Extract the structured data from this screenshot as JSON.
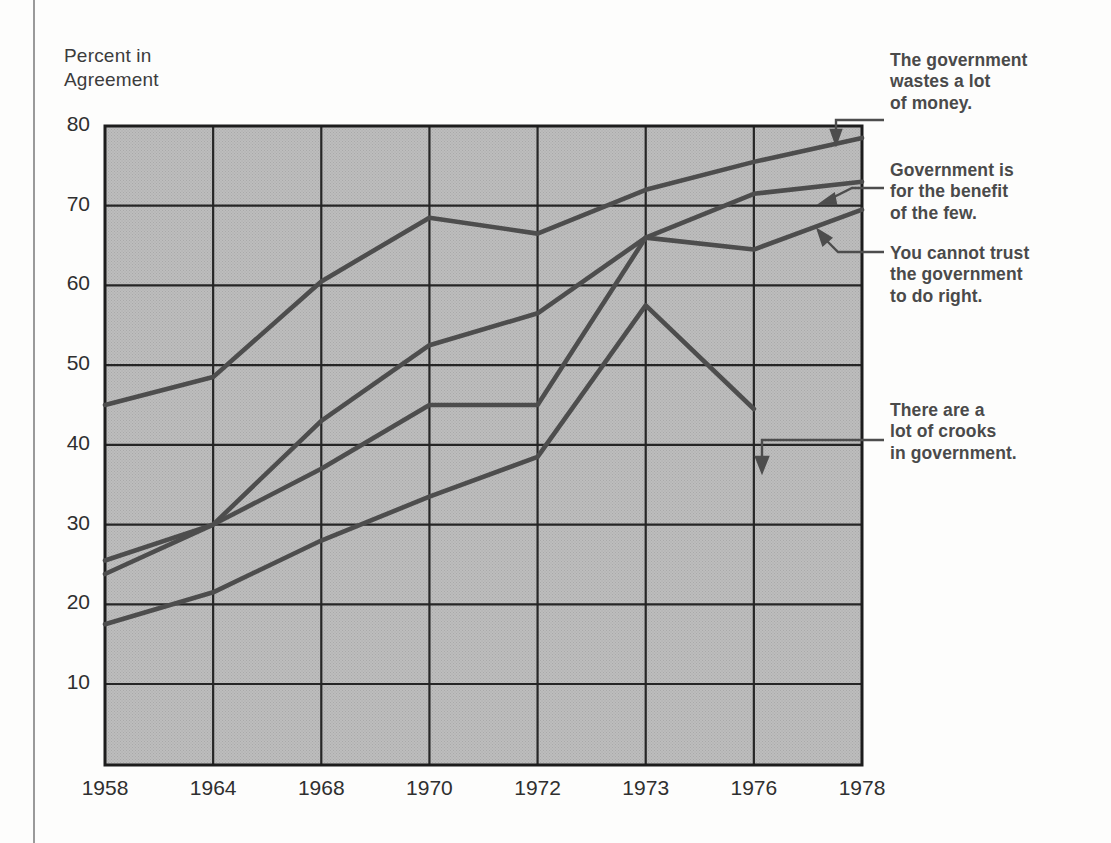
{
  "chart_data": {
    "type": "line",
    "title": "",
    "ylabel": "Percent in\nAgreement",
    "xlabel": "",
    "categories": [
      "1958",
      "1964",
      "1968",
      "1970",
      "1972",
      "1973",
      "1976",
      "1978"
    ],
    "yticks": [
      80,
      70,
      60,
      50,
      40,
      30,
      20,
      10
    ],
    "ylim": [
      0,
      80
    ],
    "grid": true,
    "legend_position": "right-annotations",
    "plot_background": "#b9b9b9",
    "line_color": "#4d4d4d",
    "series": [
      {
        "name": "The government wastes a lot of money.",
        "label": "The government\nwastes a lot\nof money.",
        "values": [
          45,
          48.5,
          60.5,
          68.5,
          66.5,
          72,
          75.5,
          78.5
        ]
      },
      {
        "name": "Government is for the benefit of the few.",
        "label": "Government is\nfor the benefit\nof the few.",
        "values": [
          25.5,
          30,
          43,
          52.5,
          56.5,
          66,
          71.5,
          73
        ]
      },
      {
        "name": "You cannot trust the government to do right.",
        "label": "You cannot trust\nthe government\nto do right.",
        "values": [
          23.8,
          30,
          37,
          45,
          45,
          66,
          64.5,
          69.5
        ]
      },
      {
        "name": "There are a lot of crooks in government.",
        "label": "There are a\nlot of crooks\nin government.",
        "values": [
          17.5,
          21.5,
          28,
          33.5,
          38.5,
          57.5,
          44.5,
          null
        ]
      }
    ]
  },
  "callouts": [
    {
      "id": "wastes",
      "text": "The government\nwastes a lot\nof money."
    },
    {
      "id": "benefit",
      "text": "Government is\nfor the benefit\nof the few."
    },
    {
      "id": "trust",
      "text": "You cannot trust\nthe government\nto do right."
    },
    {
      "id": "crooks",
      "text": "There are a\nlot of crooks\nin government."
    }
  ]
}
